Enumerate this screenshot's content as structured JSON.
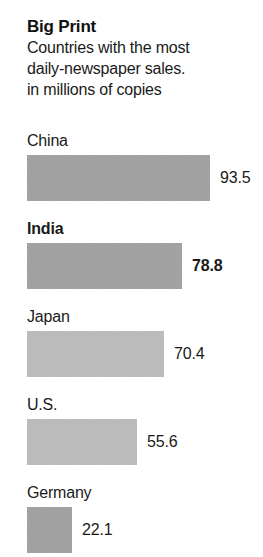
{
  "header": {
    "title": "Big Print",
    "subtitle": "Countries with the most\ndaily-newspaper sales.\nin millions of copies"
  },
  "chart_data": {
    "type": "bar",
    "orientation": "horizontal",
    "title": "Big Print",
    "subtitle": "Countries with the most daily-newspaper sales.",
    "xlabel": "in millions of copies",
    "ylabel": "",
    "grid": false,
    "legend": null,
    "xlim": [
      0,
      93.5
    ],
    "categories": [
      "China",
      "India",
      "Japan",
      "U.S.",
      "Germany"
    ],
    "values": [
      93.5,
      78.8,
      70.4,
      55.6,
      22.1
    ],
    "value_labels": [
      "93.5",
      "78.8",
      "70.4",
      "55.6",
      "22.1"
    ],
    "bars": [
      {
        "label": "China",
        "value": 93.5,
        "value_label": "93.5",
        "width_px": 183,
        "color": "#9a9a9a",
        "highlight": false
      },
      {
        "label": "India",
        "value": 78.8,
        "value_label": "78.8",
        "width_px": 155,
        "color": "#9a9a9a",
        "highlight": true
      },
      {
        "label": "Japan",
        "value": 70.4,
        "value_label": "70.4",
        "width_px": 137,
        "color": "#b5b5b5",
        "highlight": false
      },
      {
        "label": "U.S.",
        "value": 55.6,
        "value_label": "55.6",
        "width_px": 110,
        "color": "#b5b5b5",
        "highlight": false
      },
      {
        "label": "Germany",
        "value": 22.1,
        "value_label": "22.1",
        "width_px": 45,
        "color": "#9a9a9a",
        "highlight": false
      }
    ],
    "colors": {
      "bar_dark": "#9a9a9a",
      "bar_light": "#b5b5b5",
      "text": "#1a1a1a",
      "background": "#ffffff"
    }
  }
}
